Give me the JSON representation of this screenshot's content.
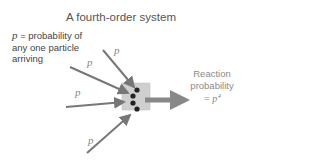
{
  "title": "A fourth-order system",
  "note": {
    "variable": "p",
    "text_line1": " = probability of",
    "text_line2": "any one particle",
    "text_line3": "arriving"
  },
  "arrow_labels": [
    "p",
    "p",
    "p",
    "p"
  ],
  "result": {
    "line1": "Reaction",
    "line2": "probability",
    "equation": "= p",
    "exponent": "4"
  },
  "colors": {
    "arrow": "#777777",
    "box": "#cccccc",
    "particle": "#222222",
    "title_text": "#555555",
    "result_text": "#8a8a8a"
  }
}
